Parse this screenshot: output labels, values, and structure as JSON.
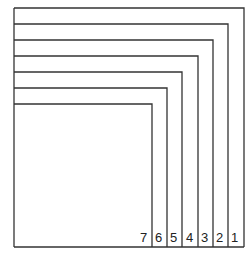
{
  "diagram": {
    "type": "nested-corner-lines",
    "line_color": "#333333",
    "labels": [
      "1",
      "2",
      "3",
      "4",
      "5",
      "6",
      "7"
    ],
    "layers": [
      {
        "label": "1",
        "top": 8,
        "right": 244
      },
      {
        "label": "2",
        "top": 24,
        "right": 228
      },
      {
        "label": "3",
        "top": 40,
        "right": 213
      },
      {
        "label": "4",
        "top": 56,
        "right": 198
      },
      {
        "label": "5",
        "top": 72,
        "right": 182
      },
      {
        "label": "6",
        "top": 88,
        "right": 167
      },
      {
        "label": "7",
        "top": 104,
        "right": 152
      }
    ],
    "frame": {
      "left": 14,
      "bottom": 247
    }
  }
}
